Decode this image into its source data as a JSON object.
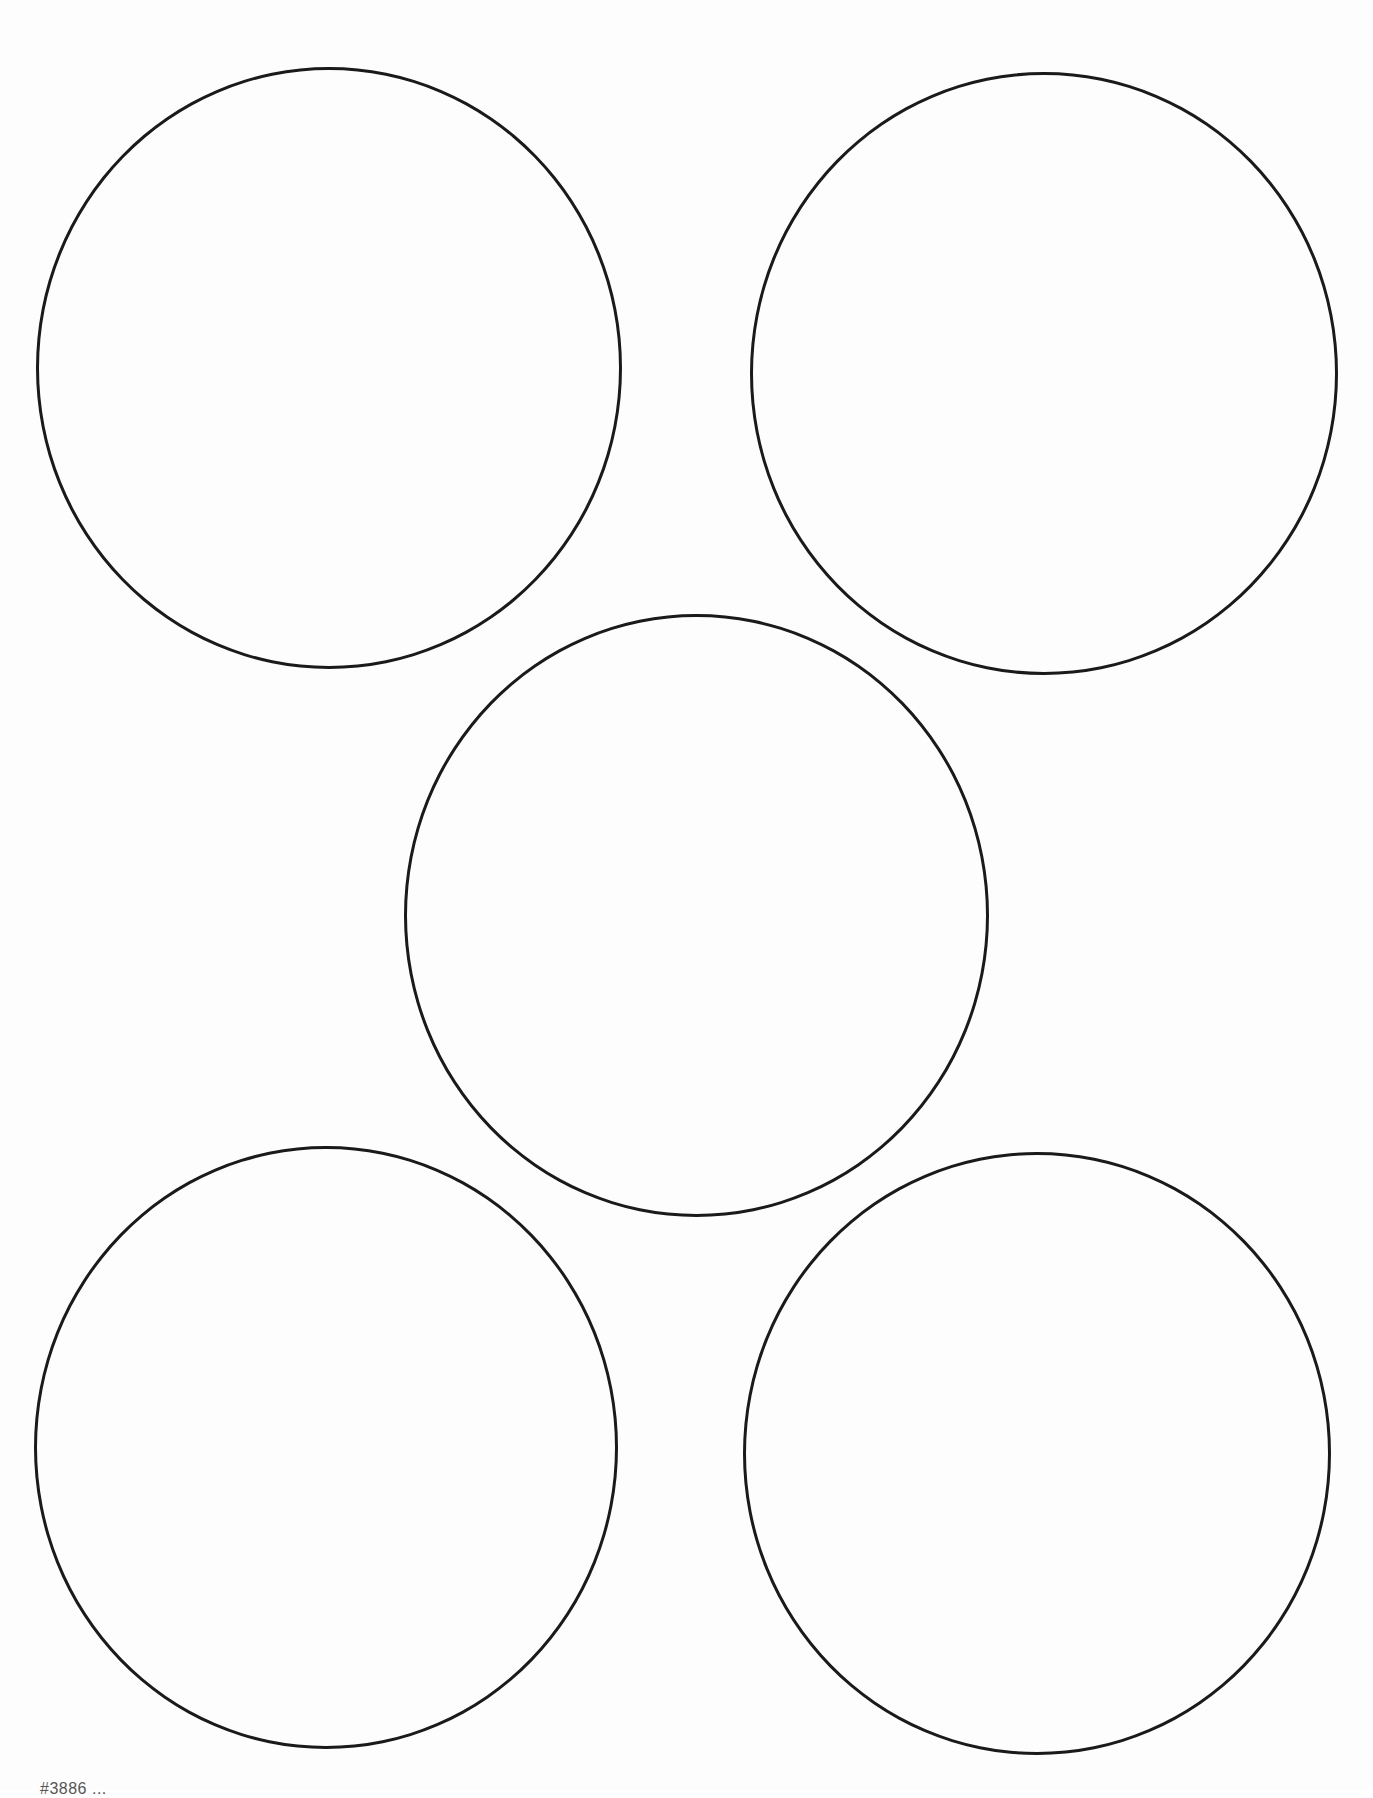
{
  "page": {
    "type": "printable-label-template",
    "background": "#ffffff",
    "stroke_color": "#1a1a1a"
  },
  "circles": [
    {
      "id": "circle-1",
      "position": "top-left"
    },
    {
      "id": "circle-2",
      "position": "top-right"
    },
    {
      "id": "circle-3",
      "position": "center"
    },
    {
      "id": "circle-4",
      "position": "bottom-left"
    },
    {
      "id": "circle-5",
      "position": "bottom-right"
    }
  ],
  "footer": {
    "text": "#3886 ..."
  }
}
